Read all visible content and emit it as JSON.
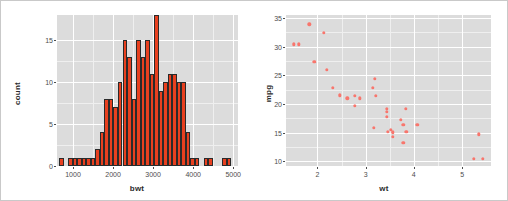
{
  "figure": {
    "background": "#ffffff",
    "border_color": "#c9c9c9",
    "panel_background": "#dcdcdc",
    "grid_color": "#ffffff"
  },
  "chart_data": [
    {
      "type": "bar",
      "id": "histogram-bwt",
      "title": "",
      "xlabel": "bwt",
      "ylabel": "count",
      "xlim": [
        600,
        5120
      ],
      "ylim": [
        0,
        18
      ],
      "xticks": [
        1000,
        2000,
        3000,
        4000,
        5000
      ],
      "yticks": [
        0,
        5,
        10,
        15
      ],
      "grid": true,
      "bar_color": "#e8401f",
      "bar_border": "#2a2a2a",
      "binwidth": 113,
      "bins": [
        {
          "x": 709,
          "value": 1
        },
        {
          "x": 822,
          "value": 0
        },
        {
          "x": 935,
          "value": 1
        },
        {
          "x": 1048,
          "value": 1
        },
        {
          "x": 1161,
          "value": 1
        },
        {
          "x": 1274,
          "value": 1
        },
        {
          "x": 1387,
          "value": 1
        },
        {
          "x": 1500,
          "value": 1
        },
        {
          "x": 1613,
          "value": 2
        },
        {
          "x": 1726,
          "value": 4
        },
        {
          "x": 1839,
          "value": 8
        },
        {
          "x": 1952,
          "value": 8
        },
        {
          "x": 2065,
          "value": 7
        },
        {
          "x": 2178,
          "value": 10
        },
        {
          "x": 2291,
          "value": 15
        },
        {
          "x": 2404,
          "value": 13
        },
        {
          "x": 2517,
          "value": 8
        },
        {
          "x": 2630,
          "value": 15
        },
        {
          "x": 2743,
          "value": 13
        },
        {
          "x": 2856,
          "value": 15
        },
        {
          "x": 2969,
          "value": 11
        },
        {
          "x": 3082,
          "value": 18
        },
        {
          "x": 3195,
          "value": 9
        },
        {
          "x": 3308,
          "value": 10
        },
        {
          "x": 3421,
          "value": 11
        },
        {
          "x": 3534,
          "value": 11
        },
        {
          "x": 3647,
          "value": 10
        },
        {
          "x": 3760,
          "value": 10
        },
        {
          "x": 3873,
          "value": 4
        },
        {
          "x": 3986,
          "value": 1
        },
        {
          "x": 4099,
          "value": 1
        },
        {
          "x": 4212,
          "value": 0
        },
        {
          "x": 4325,
          "value": 1
        },
        {
          "x": 4438,
          "value": 1
        },
        {
          "x": 4551,
          "value": 0
        },
        {
          "x": 4664,
          "value": 0
        },
        {
          "x": 4777,
          "value": 1
        },
        {
          "x": 4890,
          "value": 1
        }
      ]
    },
    {
      "type": "scatter",
      "id": "scatter-wt-mpg",
      "title": "",
      "xlabel": "wt",
      "ylabel": "mpg",
      "xlim": [
        1.35,
        5.6
      ],
      "ylim": [
        9.2,
        35.5
      ],
      "xticks": [
        2,
        3,
        4,
        5
      ],
      "yticks": [
        10,
        15,
        20,
        25,
        30,
        35
      ],
      "grid": true,
      "point_color": "#f8766d",
      "points": [
        {
          "x": 1.513,
          "y": 30.4
        },
        {
          "x": 1.615,
          "y": 30.4
        },
        {
          "x": 1.835,
          "y": 33.9
        },
        {
          "x": 1.935,
          "y": 27.3
        },
        {
          "x": 2.14,
          "y": 32.4
        },
        {
          "x": 2.2,
          "y": 26.0
        },
        {
          "x": 2.32,
          "y": 22.8
        },
        {
          "x": 2.465,
          "y": 21.5
        },
        {
          "x": 2.62,
          "y": 21.0
        },
        {
          "x": 2.77,
          "y": 19.7
        },
        {
          "x": 2.78,
          "y": 21.4
        },
        {
          "x": 2.875,
          "y": 21.0
        },
        {
          "x": 3.15,
          "y": 22.8
        },
        {
          "x": 3.17,
          "y": 15.8
        },
        {
          "x": 3.19,
          "y": 24.4
        },
        {
          "x": 3.215,
          "y": 21.4
        },
        {
          "x": 3.44,
          "y": 18.7
        },
        {
          "x": 3.44,
          "y": 19.2
        },
        {
          "x": 3.44,
          "y": 17.8
        },
        {
          "x": 3.46,
          "y": 15.2
        },
        {
          "x": 3.52,
          "y": 15.5
        },
        {
          "x": 3.57,
          "y": 14.3
        },
        {
          "x": 3.57,
          "y": 15.0
        },
        {
          "x": 3.57,
          "y": 15.2
        },
        {
          "x": 3.73,
          "y": 17.3
        },
        {
          "x": 3.78,
          "y": 16.4
        },
        {
          "x": 3.78,
          "y": 13.3
        },
        {
          "x": 3.84,
          "y": 19.2
        },
        {
          "x": 3.845,
          "y": 15.2
        },
        {
          "x": 4.07,
          "y": 16.4
        },
        {
          "x": 5.25,
          "y": 10.4
        },
        {
          "x": 5.345,
          "y": 14.7
        },
        {
          "x": 5.424,
          "y": 10.4
        }
      ]
    }
  ]
}
